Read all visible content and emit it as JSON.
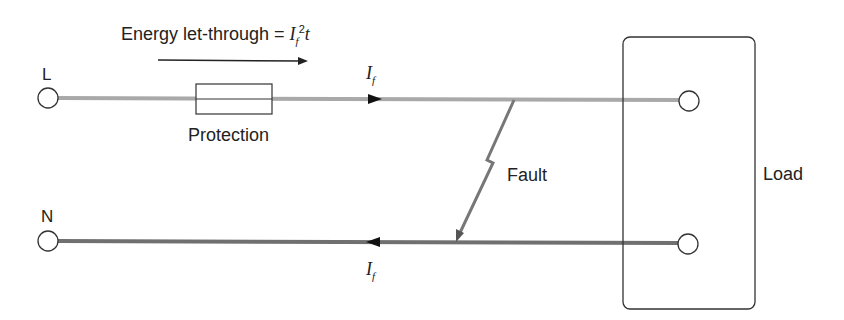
{
  "diagram": {
    "title_text": "Energy let-through = ",
    "title_formula": {
      "base": "I",
      "sub": "f",
      "sup": "2",
      "tail": "t"
    },
    "terminals": {
      "live": "L",
      "neutral": "N"
    },
    "protection_label": "Protection",
    "fault_label": "Fault",
    "load_label": "Load",
    "current_label": {
      "base": "I",
      "sub": "f"
    }
  },
  "colors": {
    "live_wire": "#a9a9a9",
    "neutral_wire": "#707070",
    "fault_path": "#777777",
    "outline": "#333333"
  }
}
